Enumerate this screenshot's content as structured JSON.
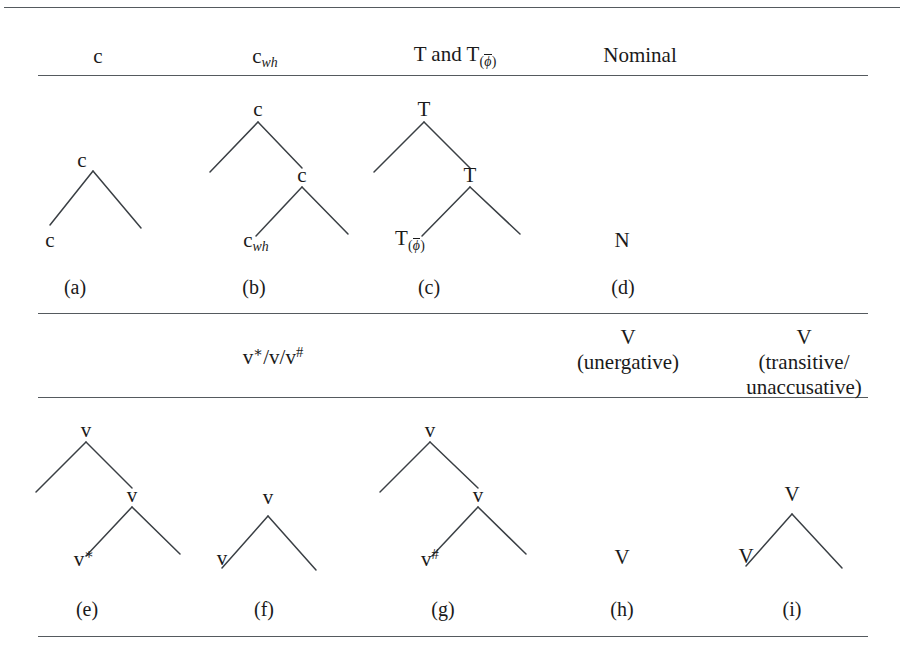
{
  "figure": {
    "kind": "syntactic-category-table",
    "rules": [
      {
        "name": "top-rule",
        "y": 7,
        "span": "full"
      },
      {
        "name": "header-rule-1",
        "y": 75,
        "span": "inset"
      },
      {
        "name": "section-rule-1",
        "y": 313,
        "span": "inset"
      },
      {
        "name": "header-rule-2",
        "y": 397,
        "span": "inset"
      },
      {
        "name": "bottom-rule",
        "y": 636,
        "span": "inset"
      }
    ]
  },
  "header_row_1": {
    "columns": [
      {
        "id": "c",
        "text": "c",
        "sub": "",
        "sub_style": "none"
      },
      {
        "id": "c-wh",
        "text": "c",
        "sub": "wh",
        "sub_style": "italic"
      },
      {
        "id": "t-and-t",
        "text": "T and T",
        "sub": "(ϕ̄)",
        "sub_style": "overline-paren"
      },
      {
        "id": "nominal",
        "text": "Nominal",
        "sub": "",
        "sub_style": "none"
      }
    ],
    "labels": {
      "c": "c",
      "c_wh": "c",
      "c_wh_sub": "wh",
      "t_and_t": "T and T",
      "t_sub_open": "(",
      "t_sub_phi": "ϕ",
      "t_sub_close": ")",
      "nominal": "Nominal"
    }
  },
  "header_row_2": {
    "labels": {
      "v_star_slash": "v",
      "v_star_sup": "∗",
      "v_mid": "/v/v",
      "v_hash_sup": "#",
      "v_unergative_node": "V",
      "v_unergative_gloss": "(unergative)",
      "v_transitive_node": "V",
      "v_transitive_gloss_line1": "(transitive/",
      "v_transitive_gloss_line2": "unaccusative)"
    }
  },
  "trees_row_1": [
    {
      "id": "a",
      "caption": "(a)",
      "levels": 1,
      "nodes": {
        "root": "c",
        "leaf": "c"
      },
      "root_label": "c",
      "leaf_label": "c"
    },
    {
      "id": "b",
      "caption": "(b)",
      "levels": 2,
      "root_label": "c",
      "inner_label": "c",
      "leaf_label": "c",
      "leaf_sub": "wh"
    },
    {
      "id": "c",
      "caption": "(c)",
      "levels": 2,
      "root_label": "T",
      "inner_label": "T",
      "leaf_label": "T",
      "leaf_sub_open": "(",
      "leaf_sub_phi": "ϕ",
      "leaf_sub_close": ")"
    },
    {
      "id": "d",
      "caption": "(d)",
      "levels": 0,
      "leaf_label": "N"
    }
  ],
  "trees_row_2": [
    {
      "id": "e",
      "caption": "(e)",
      "levels": 2,
      "root_label": "v",
      "inner_label": "v",
      "leaf_label": "v",
      "leaf_sup": "∗"
    },
    {
      "id": "f",
      "caption": "(f)",
      "levels": 1,
      "root_label": "v",
      "leaf_label": "v"
    },
    {
      "id": "g",
      "caption": "(g)",
      "levels": 2,
      "root_label": "v",
      "inner_label": "v",
      "leaf_label": "v",
      "leaf_sup": "#"
    },
    {
      "id": "h",
      "caption": "(h)",
      "levels": 0,
      "leaf_label": "V"
    },
    {
      "id": "i",
      "caption": "(i)",
      "levels": 1,
      "root_label": "V",
      "leaf_label": "V"
    }
  ],
  "colors": {
    "ink": "#1a1a1a",
    "rule": "#555a5e",
    "branch": "#3a3f44",
    "background": "#ffffff"
  }
}
